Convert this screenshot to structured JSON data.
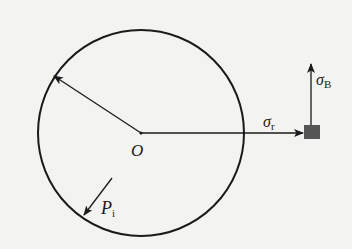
{
  "diagram": {
    "colors": {
      "background": "#f3f3f1",
      "stroke": "#1a1a1a",
      "element_fill": "#555555"
    },
    "circle": {
      "cx": 141,
      "cy": 133,
      "r": 103
    },
    "labels": {
      "center": {
        "symbol": "O",
        "sub": ""
      },
      "radial_stress": {
        "symbol": "σ",
        "sub": "r"
      },
      "hoop_stress": {
        "symbol": "σ",
        "sub": "B"
      },
      "internal_pressure": {
        "symbol": "P",
        "sub": "i"
      }
    },
    "arrows": [
      {
        "name": "radius-arrow",
        "from": [
          141,
          133
        ],
        "to": [
          54,
          76
        ]
      },
      {
        "name": "radial-stress-arrow",
        "from": [
          141,
          133
        ],
        "to": [
          303,
          133
        ]
      },
      {
        "name": "hoop-stress-arrow",
        "from": [
          311,
          125
        ],
        "to": [
          311,
          64
        ]
      },
      {
        "name": "pressure-arrow",
        "from": [
          112,
          178
        ],
        "to": [
          84,
          215
        ]
      }
    ],
    "stress_element": {
      "x": 304,
      "y": 125,
      "w": 16,
      "h": 14
    }
  }
}
